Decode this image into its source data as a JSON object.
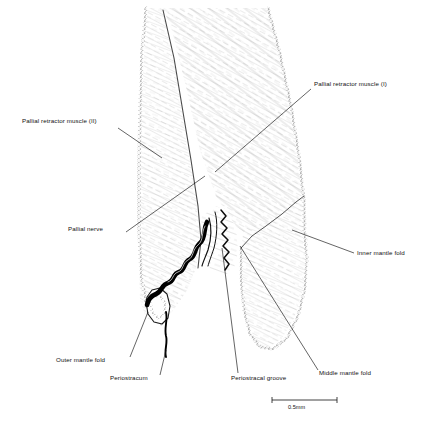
{
  "figure": {
    "type": "anatomical-illustration",
    "background_color": "#ffffff",
    "ink_color": "#111111"
  },
  "labels": [
    {
      "id": "pallial-retractor-muscle-2",
      "text": "Pallial retractor muscle (II)",
      "side": "left",
      "text_x": 22,
      "text_y": 122,
      "leader": {
        "x1": 118,
        "y1": 128,
        "x2": 162,
        "y2": 158
      }
    },
    {
      "id": "pallial-nerve",
      "text": "Pallial nerve",
      "side": "left",
      "text_x": 68,
      "text_y": 230,
      "leader": {
        "x1": 126,
        "y1": 232,
        "x2": 205,
        "y2": 176
      }
    },
    {
      "id": "pallial-retractor-muscle-1",
      "text": "Pallial retractor muscle (I)",
      "side": "right",
      "text_x": 314,
      "text_y": 85,
      "leader": {
        "x1": 311,
        "y1": 89,
        "x2": 215,
        "y2": 172
      }
    },
    {
      "id": "inner-mantle-fold",
      "text": "Inner mantle fold",
      "side": "right",
      "text_x": 357,
      "text_y": 254,
      "leader": {
        "x1": 354,
        "y1": 253,
        "x2": 292,
        "y2": 230
      }
    },
    {
      "id": "outer-mantle-fold",
      "text": "Outer mantle fold",
      "side": "left",
      "text_x": 56,
      "text_y": 361,
      "leader": {
        "x1": 130,
        "y1": 357,
        "x2": 148,
        "y2": 312
      }
    },
    {
      "id": "periostracum",
      "text": "Periostracum",
      "side": "left",
      "text_x": 110,
      "text_y": 379,
      "leader": {
        "x1": 160,
        "y1": 375,
        "x2": 166,
        "y2": 350
      }
    },
    {
      "id": "periostracal-groove",
      "text": "Periostracal groove",
      "side": "bottom",
      "text_x": 231,
      "text_y": 379,
      "leader": {
        "x1": 238,
        "y1": 373,
        "x2": 222,
        "y2": 248
      }
    },
    {
      "id": "middle-mantle-fold",
      "text": "Middle mantle fold",
      "side": "bottom-right",
      "text_x": 319,
      "text_y": 374,
      "leader": {
        "x1": 318,
        "y1": 370,
        "x2": 240,
        "y2": 246
      }
    }
  ],
  "scale_bar": {
    "label": "0.5mm",
    "x1": 272,
    "x2": 337,
    "y": 400,
    "tick_height": 4,
    "caption_x": 288,
    "caption_y": 404
  }
}
